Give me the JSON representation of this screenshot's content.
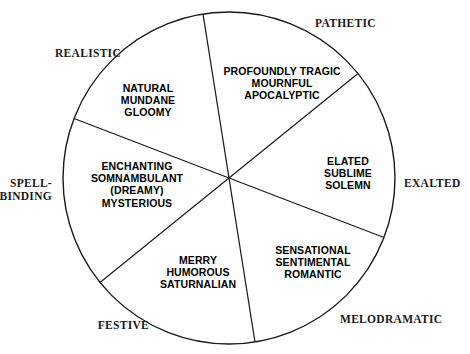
{
  "diagram": {
    "shape": "circle",
    "stroke_color": "#1a1a1a",
    "background_color": "#ffffff",
    "center": {
      "x": 229,
      "y": 178
    },
    "radius": 166,
    "sector_count": 6,
    "divider_rotation_degrees": -9
  },
  "sectors": [
    {
      "id": "tragic",
      "label": "PROFOUNDLY TRAGIC\nMOURNFUL\nAPOCALYPTIC",
      "lines": [
        "PROFOUNDLY TRAGIC",
        "MOURNFUL",
        "APOCALYPTIC"
      ],
      "label_x": 282,
      "label_y": 83
    },
    {
      "id": "exalted",
      "label": "ELATED\nSUBLIME\nSOLEMN",
      "lines": [
        "ELATED",
        "SUBLIME",
        "SOLEMN"
      ],
      "label_x": 348,
      "label_y": 173
    },
    {
      "id": "melodramatic",
      "label": "SENSATIONAL\nSENTIMENTAL\nROMANTIC",
      "lines": [
        "SENSATIONAL",
        "SENTIMENTAL",
        "ROMANTIC"
      ],
      "label_x": 313,
      "label_y": 262
    },
    {
      "id": "festive",
      "label": "MERRY\nHUMOROUS\nSATURNALIAN",
      "lines": [
        "MERRY",
        "HUMOROUS",
        "SATURNALIAN"
      ],
      "label_x": 198,
      "label_y": 272
    },
    {
      "id": "spellbinding",
      "label": "ENCHANTING\nSOMNAMBULANT\n(DREAMY)\nMYSTERIOUS",
      "lines": [
        "ENCHANTING",
        "SOMNAMBULANT",
        "(DREAMY)",
        "MYSTERIOUS"
      ],
      "label_x": 137,
      "label_y": 184
    },
    {
      "id": "realistic",
      "label": "NATURAL\nMUNDANE\nGLOOMY",
      "lines": [
        "NATURAL",
        "MUNDANE",
        "GLOOMY"
      ],
      "label_x": 148,
      "label_y": 100
    }
  ],
  "axis_labels": [
    {
      "id": "pathetic",
      "text": "PATHETIC",
      "x": 315,
      "y": 23,
      "align": "al-left"
    },
    {
      "id": "exalted",
      "text": "EXALTED",
      "x": 404,
      "y": 183,
      "align": "al-left"
    },
    {
      "id": "melodramatic",
      "text": "MELODRAMATIC",
      "x": 340,
      "y": 319,
      "align": "al-left"
    },
    {
      "id": "festive",
      "text": "FESTIVE",
      "x": 149,
      "y": 325,
      "align": "al-right"
    },
    {
      "id": "spellbinding",
      "text": "SPELL-\nBINDING",
      "x": 52,
      "y": 190,
      "align": "al-right"
    },
    {
      "id": "realistic",
      "text": "REALISTIC",
      "x": 121,
      "y": 53,
      "align": "al-right"
    }
  ]
}
